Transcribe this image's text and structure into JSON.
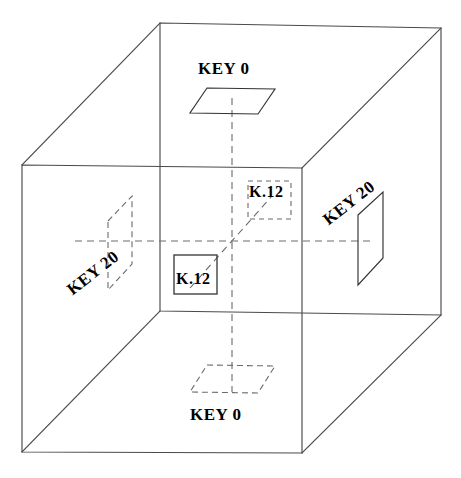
{
  "figure": {
    "type": "3d-cube-diagram",
    "canvas": {
      "width": 461,
      "height": 478
    },
    "stroke_color": "#4a4a4a",
    "dash_color": "#6b6b6b",
    "solid_plane_color": "#333333",
    "background": "#ffffff"
  },
  "cube": {
    "name": "outer-cube",
    "front_face": [
      {
        "x": 22,
        "y": 165
      },
      {
        "x": 302,
        "y": 168
      },
      {
        "x": 302,
        "y": 453
      },
      {
        "x": 22,
        "y": 452
      }
    ],
    "back_face": [
      {
        "x": 160,
        "y": 23
      },
      {
        "x": 441,
        "y": 28
      },
      {
        "x": 441,
        "y": 315
      },
      {
        "x": 160,
        "y": 311
      }
    ],
    "connectors": [
      [
        {
          "x": 22,
          "y": 165
        },
        {
          "x": 160,
          "y": 23
        }
      ],
      [
        {
          "x": 302,
          "y": 168
        },
        {
          "x": 441,
          "y": 28
        }
      ],
      [
        {
          "x": 302,
          "y": 453
        },
        {
          "x": 441,
          "y": 315
        }
      ],
      [
        {
          "x": 22,
          "y": 452
        },
        {
          "x": 160,
          "y": 311
        }
      ]
    ]
  },
  "axes": {
    "vertical": {
      "x": 232,
      "y1": 98,
      "y2": 392,
      "style": "dashed"
    },
    "horizontal": {
      "y": 241,
      "x1": 75,
      "x2": 375,
      "style": "dashed"
    },
    "diagonal": {
      "x1": 190,
      "y1": 288,
      "x2": 272,
      "y2": 196,
      "style": "dashed"
    }
  },
  "planes": [
    {
      "id": "key0-top",
      "label": "KEY 0",
      "style": "solid",
      "shape": "parallelogram",
      "points": [
        {
          "x": 207,
          "y": 88
        },
        {
          "x": 275,
          "y": 89
        },
        {
          "x": 258,
          "y": 114
        },
        {
          "x": 190,
          "y": 113
        }
      ]
    },
    {
      "id": "key0-bottom",
      "label": "KEY 0",
      "style": "dashed",
      "shape": "parallelogram",
      "points": [
        {
          "x": 207,
          "y": 365
        },
        {
          "x": 275,
          "y": 366
        },
        {
          "x": 258,
          "y": 393
        },
        {
          "x": 190,
          "y": 392
        }
      ]
    },
    {
      "id": "key20-left",
      "label": "KEY 20",
      "style": "dashed",
      "shape": "parallelogram",
      "points": [
        {
          "x": 108,
          "y": 221
        },
        {
          "x": 132,
          "y": 196
        },
        {
          "x": 132,
          "y": 264
        },
        {
          "x": 108,
          "y": 290
        }
      ]
    },
    {
      "id": "key20-right",
      "label": "KEY 20",
      "style": "solid",
      "shape": "parallelogram",
      "points": [
        {
          "x": 358,
          "y": 215
        },
        {
          "x": 383,
          "y": 192
        },
        {
          "x": 383,
          "y": 258
        },
        {
          "x": 358,
          "y": 285
        }
      ]
    },
    {
      "id": "k12-upper",
      "label": "K.12",
      "style": "dashed",
      "shape": "square",
      "rect": {
        "x": 248,
        "y": 181,
        "w": 43,
        "h": 38
      }
    },
    {
      "id": "k12-lower",
      "label": "K.12",
      "style": "solid",
      "shape": "square",
      "rect": {
        "x": 174,
        "y": 255,
        "w": 43,
        "h": 39
      }
    }
  ],
  "labels": {
    "key0_top": "KEY 0",
    "key0_bottom": "KEY 0",
    "key20_left": "KEY 20",
    "key20_right": "KEY 20",
    "k12_upper": "K.12",
    "k12_lower": "K.12"
  }
}
